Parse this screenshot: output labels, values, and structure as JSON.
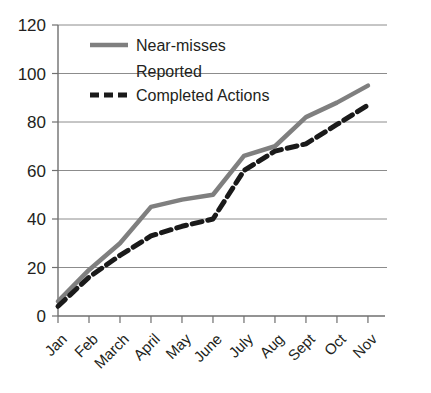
{
  "chart_data": {
    "type": "line",
    "title": "",
    "xlabel": "",
    "ylabel": "",
    "categories": [
      "Jan",
      "Feb",
      "March",
      "April",
      "May",
      "June",
      "July",
      "Aug",
      "Sept",
      "Oct",
      "Nov"
    ],
    "ylim": [
      0,
      120
    ],
    "yticks": [
      0,
      20,
      40,
      60,
      80,
      100,
      120
    ],
    "ytick_labels": [
      "0",
      "20",
      "40",
      "60",
      "80",
      "100",
      "120"
    ],
    "grid": "horizontal",
    "legend_position": "top-left-inside",
    "series": [
      {
        "name": "Near-misses Reported",
        "style": "solid",
        "color": "#7f7f7f",
        "values": [
          6,
          19,
          30,
          45,
          48,
          50,
          66,
          70,
          82,
          88,
          95
        ]
      },
      {
        "name": "Completed Actions",
        "style": "dashed",
        "color": "#1a1a1a",
        "values": [
          4,
          16,
          25,
          33,
          37,
          40,
          60,
          68,
          71,
          79,
          87
        ]
      }
    ]
  },
  "legend": {
    "entries": [
      {
        "label_line1": "Near-misses",
        "label_line2": "Reported",
        "swatch": "solid-line-swatch"
      },
      {
        "label_line1": "Completed Actions",
        "label_line2": "",
        "swatch": "dashed-line-swatch"
      }
    ]
  },
  "colors": {
    "series_near_misses": "#7f7f7f",
    "series_completed_actions": "#1a1a1a",
    "gridline": "#8c8c8c",
    "axis": "#6f6f6f",
    "text": "#231f20",
    "background": "#ffffff"
  }
}
